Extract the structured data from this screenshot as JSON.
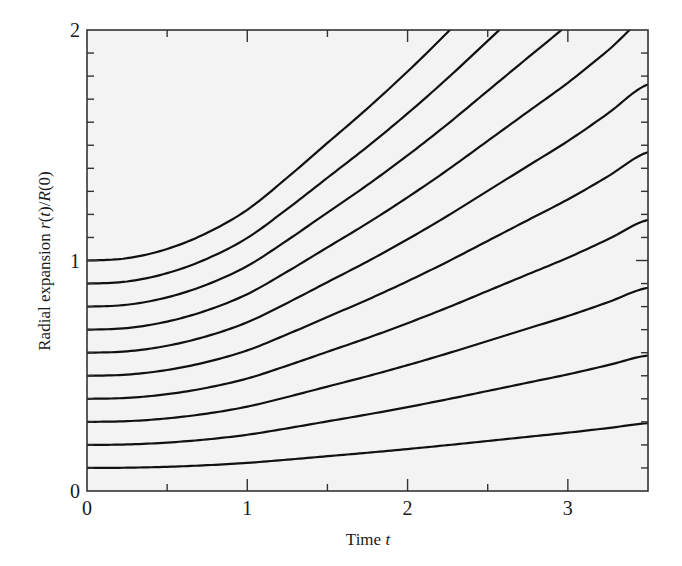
{
  "chart_data": {
    "type": "line",
    "title": "",
    "xlabel": "Time t",
    "xlabel_parts": [
      {
        "text": "Time ",
        "italic": false
      },
      {
        "text": "t",
        "italic": true
      }
    ],
    "ylabel": "Radial expansion r(t)/R(0)",
    "ylabel_parts": [
      {
        "text": "Radial expansion ",
        "italic": false
      },
      {
        "text": "r",
        "italic": true
      },
      {
        "text": "(",
        "italic": false
      },
      {
        "text": "t",
        "italic": true
      },
      {
        "text": ")/",
        "italic": false
      },
      {
        "text": "R",
        "italic": true
      },
      {
        "text": "(0)",
        "italic": false
      }
    ],
    "xlim": [
      0,
      3.5
    ],
    "ylim": [
      0,
      2
    ],
    "x_ticks_major": [
      0,
      1,
      2,
      3
    ],
    "x_tick_labels": [
      "0",
      "1",
      "2",
      "3"
    ],
    "x_ticks_minor": [
      0.5,
      1.5,
      2.5
    ],
    "y_ticks_major": [
      0,
      1,
      2
    ],
    "y_tick_labels": [
      "0",
      "1",
      "2"
    ],
    "y_ticks_minor": [
      0.1,
      0.2,
      0.3,
      0.4,
      0.5,
      0.6,
      0.7,
      0.8,
      0.9,
      1.1,
      1.2,
      1.3,
      1.4,
      1.5,
      1.6,
      1.7,
      1.8,
      1.9
    ],
    "grid": false,
    "legend": null,
    "growth_factor": {
      "t": [
        0,
        0.25,
        0.5,
        0.75,
        1.0,
        1.25,
        1.5,
        1.75,
        2.0,
        2.25,
        2.5,
        2.75,
        3.0,
        3.25,
        3.5
      ],
      "f": [
        1.0,
        1.01,
        1.05,
        1.12,
        1.22,
        1.36,
        1.51,
        1.66,
        1.82,
        1.99,
        2.17,
        2.35,
        2.53,
        2.73,
        2.94
      ]
    },
    "series": [
      {
        "name": "r0=0.1",
        "r0": 0.1
      },
      {
        "name": "r0=0.2",
        "r0": 0.2
      },
      {
        "name": "r0=0.3",
        "r0": 0.3
      },
      {
        "name": "r0=0.4",
        "r0": 0.4
      },
      {
        "name": "r0=0.5",
        "r0": 0.5
      },
      {
        "name": "r0=0.6",
        "r0": 0.6
      },
      {
        "name": "r0=0.7",
        "r0": 0.7
      },
      {
        "name": "r0=0.8",
        "r0": 0.8
      },
      {
        "name": "r0=0.9",
        "r0": 0.9
      },
      {
        "name": "r0=1.0",
        "r0": 1.0
      }
    ],
    "colors": {
      "line": "#111111",
      "axes": "#333333",
      "plot_bg": "#f3f3f3",
      "page_bg": "#ffffff"
    }
  }
}
